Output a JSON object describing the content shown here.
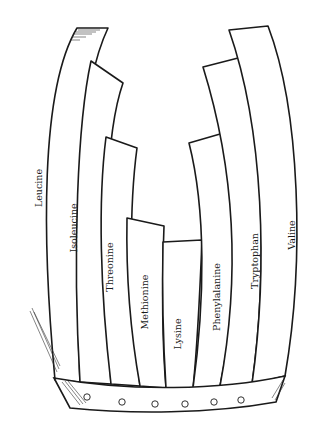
{
  "diagram": {
    "title": "",
    "type": "Liebig's barrel (limiting amino acid)",
    "staves": [
      {
        "label": "Leucine"
      },
      {
        "label": "Isoleucine"
      },
      {
        "label": "Threonine"
      },
      {
        "label": "Methionine"
      },
      {
        "label": "Lysine"
      },
      {
        "label": "Phenylalanine"
      },
      {
        "label": "Tryptophan"
      },
      {
        "label": "Valine"
      }
    ],
    "band": {
      "holes": 6
    },
    "colors": {
      "stroke": "#1a1a1a",
      "fill": "#ffffff"
    }
  }
}
